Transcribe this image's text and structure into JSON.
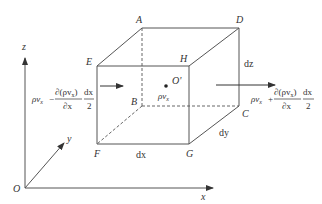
{
  "diagram": {
    "type": "control-volume-cube",
    "colors": {
      "line": "#555555",
      "text": "#333333",
      "background": "#ffffff"
    },
    "axes": {
      "origin_label": "O",
      "x_label": "x",
      "y_label": "y",
      "z_label": "z"
    },
    "vertices": {
      "A": "A",
      "B": "B",
      "C": "C",
      "D": "D",
      "E": "E",
      "F": "F",
      "G": "G",
      "H": "H"
    },
    "center": {
      "label": "O'",
      "quantity": "ρv",
      "quantity_sub": "x"
    },
    "dimensions": {
      "dx": "dx",
      "dy": "dy",
      "dz": "dz"
    },
    "inflow": {
      "base": "ρv",
      "base_sub": "x",
      "sign": "−",
      "numerator": "∂(ρv",
      "numerator_sub": "x",
      "numerator_close": ")",
      "denominator": "∂x",
      "frac2_num": "dx",
      "frac2_den": "2"
    },
    "outflow": {
      "base": "ρv",
      "base_sub": "x",
      "sign": "+",
      "numerator": "∂(ρv",
      "numerator_sub": "x",
      "numerator_close": ")",
      "denominator": "∂x",
      "frac2_num": "dx",
      "frac2_den": "2"
    }
  }
}
